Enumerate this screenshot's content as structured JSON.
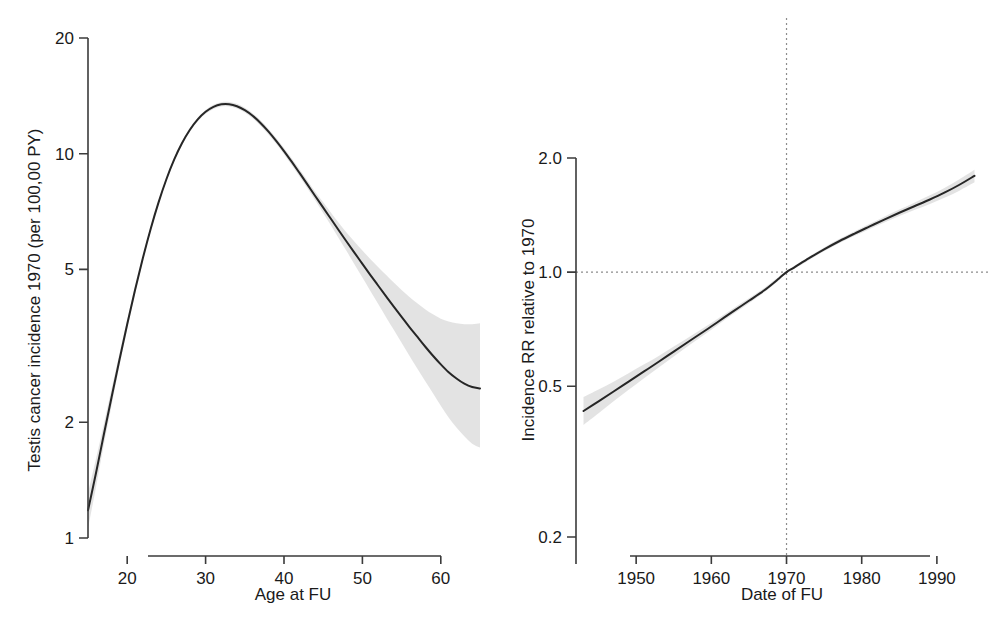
{
  "figure": {
    "background": "#ffffff",
    "curve_color": "#262626",
    "band_color": "#d8d8d8",
    "axis_color": "#3b3b3b",
    "reference_line_color": "#8c8c8c"
  },
  "panels": [
    {
      "id": "left",
      "name": "testis-cancer-incidence-by-age",
      "xlabel": "Age at FU",
      "ylabel": "Testis cancer incidence 1970 (per 100,00 PY)",
      "x_ticks": [
        "20",
        "30",
        "40",
        "50",
        "60"
      ],
      "y_ticks": [
        "20",
        "10",
        "5",
        "2",
        "1"
      ]
    },
    {
      "id": "right",
      "name": "incidence-rate-ratio-by-calendar-date",
      "xlabel": "Date of FU",
      "ylabel": "Incidence RR relative to 1970",
      "x_ticks": [
        "1950",
        "1960",
        "1970",
        "1980",
        "1990"
      ],
      "y_ticks": [
        "2.0",
        "1.0",
        "0.5",
        "0.2"
      ]
    }
  ],
  "chart_data": [
    {
      "type": "line",
      "id": "left",
      "title": "",
      "xlabel": "Age at FU",
      "ylabel": "Testis cancer incidence 1970 (per 100,00 PY)",
      "xlim": [
        15,
        65
      ],
      "ylim": [
        1,
        20
      ],
      "yscale": "log",
      "xscale": "linear",
      "grid": false,
      "legend": false,
      "xticks": [
        20,
        30,
        40,
        50,
        60
      ],
      "yticks": [
        1,
        2,
        5,
        10,
        20
      ],
      "series": [
        {
          "name": "Testis cancer incidence (1970)",
          "x": [
            15,
            16,
            17,
            18,
            19,
            20,
            21,
            22,
            23,
            24,
            25,
            26,
            27,
            28,
            29,
            30,
            31,
            32,
            33,
            34,
            35,
            36,
            37,
            38,
            39,
            40,
            41,
            42,
            43,
            44,
            45,
            46,
            47,
            48,
            49,
            50,
            51,
            52,
            53,
            54,
            55,
            56,
            57,
            58,
            59,
            60,
            61,
            62,
            63,
            64,
            65
          ],
          "y": [
            1.18,
            1.47,
            1.85,
            2.32,
            2.9,
            3.6,
            4.42,
            5.35,
            6.38,
            7.47,
            8.58,
            9.66,
            10.66,
            11.54,
            12.28,
            12.85,
            13.24,
            13.44,
            13.45,
            13.29,
            12.98,
            12.55,
            12.02,
            11.43,
            10.8,
            10.16,
            9.52,
            8.9,
            8.31,
            7.75,
            7.24,
            6.76,
            6.31,
            5.9,
            5.52,
            5.17,
            4.84,
            4.54,
            4.26,
            4.0,
            3.76,
            3.54,
            3.34,
            3.15,
            2.98,
            2.83,
            2.7,
            2.6,
            2.52,
            2.47,
            2.45
          ],
          "ci_low": [
            1.06,
            1.35,
            1.74,
            2.21,
            2.8,
            3.5,
            4.32,
            5.26,
            6.29,
            7.38,
            8.49,
            9.56,
            10.55,
            11.42,
            12.14,
            12.7,
            13.08,
            13.27,
            13.27,
            13.1,
            12.79,
            12.36,
            11.83,
            11.24,
            10.61,
            9.97,
            9.33,
            8.71,
            8.12,
            7.55,
            7.01,
            6.5,
            6.02,
            5.57,
            5.15,
            4.76,
            4.4,
            4.07,
            3.76,
            3.48,
            3.22,
            2.98,
            2.76,
            2.56,
            2.38,
            2.21,
            2.06,
            1.94,
            1.84,
            1.76,
            1.72
          ],
          "ci_high": [
            1.31,
            1.6,
            1.97,
            2.44,
            3.01,
            3.7,
            4.52,
            5.44,
            6.47,
            7.56,
            8.67,
            9.76,
            10.77,
            11.66,
            12.42,
            13.0,
            13.4,
            13.61,
            13.63,
            13.48,
            13.17,
            12.74,
            12.21,
            11.62,
            10.99,
            10.35,
            9.71,
            9.09,
            8.5,
            7.95,
            7.47,
            7.02,
            6.6,
            6.23,
            5.9,
            5.6,
            5.32,
            5.07,
            4.84,
            4.62,
            4.42,
            4.24,
            4.08,
            3.94,
            3.82,
            3.72,
            3.66,
            3.62,
            3.6,
            3.6,
            3.62
          ]
        }
      ]
    },
    {
      "type": "line",
      "id": "right",
      "title": "",
      "xlabel": "Date of FU",
      "ylabel": "Incidence RR relative to 1970",
      "xlim": [
        1942,
        1996
      ],
      "ylim": [
        0.2,
        2.0
      ],
      "yscale": "log",
      "xscale": "linear",
      "grid": false,
      "legend": false,
      "xticks": [
        1950,
        1960,
        1970,
        1980,
        1990
      ],
      "yticks": [
        0.2,
        0.5,
        1.0,
        2.0
      ],
      "reference_lines": [
        {
          "axis": "x",
          "value": 1970,
          "style": "dotted"
        },
        {
          "axis": "y",
          "value": 1.0,
          "style": "dotted"
        }
      ],
      "series": [
        {
          "name": "Incidence RR relative to 1970",
          "x": [
            1943,
            1945,
            1947,
            1949,
            1951,
            1953,
            1955,
            1957,
            1959,
            1961,
            1963,
            1965,
            1967,
            1969,
            1970,
            1971,
            1973,
            1975,
            1977,
            1979,
            1981,
            1983,
            1985,
            1987,
            1989,
            1991,
            1993,
            1995
          ],
          "y": [
            0.43,
            0.456,
            0.484,
            0.514,
            0.546,
            0.58,
            0.617,
            0.656,
            0.697,
            0.742,
            0.79,
            0.84,
            0.894,
            0.962,
            1.0,
            1.028,
            1.088,
            1.148,
            1.206,
            1.262,
            1.318,
            1.376,
            1.434,
            1.492,
            1.552,
            1.62,
            1.7,
            1.795
          ],
          "ci_low": [
            0.395,
            0.424,
            0.456,
            0.489,
            0.524,
            0.56,
            0.599,
            0.64,
            0.682,
            0.728,
            0.777,
            0.828,
            0.883,
            0.952,
            1.0,
            1.019,
            1.077,
            1.135,
            1.191,
            1.245,
            1.298,
            1.352,
            1.406,
            1.458,
            1.51,
            1.57,
            1.64,
            1.725
          ],
          "ci_high": [
            0.468,
            0.49,
            0.514,
            0.541,
            0.57,
            0.601,
            0.636,
            0.673,
            0.713,
            0.757,
            0.804,
            0.853,
            0.906,
            0.973,
            1.0,
            1.038,
            1.1,
            1.162,
            1.222,
            1.28,
            1.339,
            1.4,
            1.462,
            1.525,
            1.592,
            1.668,
            1.758,
            1.862
          ]
        }
      ]
    }
  ]
}
